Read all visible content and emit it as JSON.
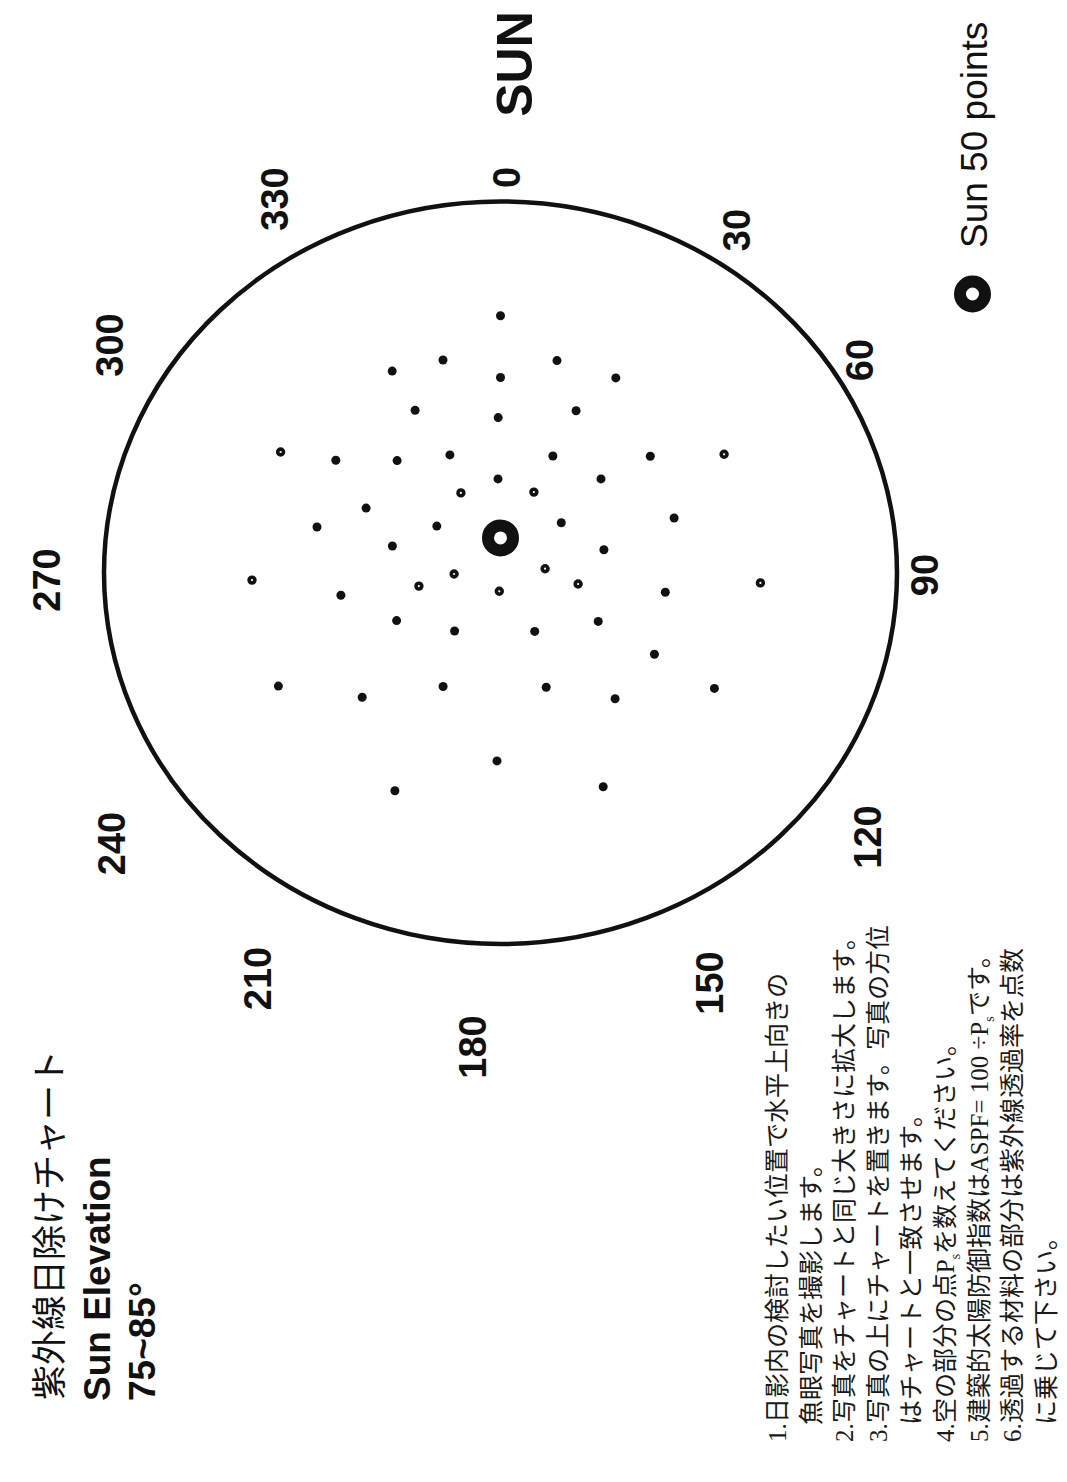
{
  "header": {
    "title_jp": "紫外線日除けチャート",
    "title_en": "Sun Elevation",
    "elevation_range": "75~85°"
  },
  "chart_data": {
    "type": "scatter",
    "projection": "polar sky chart",
    "title": "紫外線日除けチャート",
    "subtitle": "Sun Elevation 75~85°",
    "direction_label": "SUN",
    "angle_labels": [
      {
        "label": "0",
        "az": 0
      },
      {
        "label": "30",
        "az": 30
      },
      {
        "label": "60",
        "az": 60
      },
      {
        "label": "90",
        "az": 90
      },
      {
        "label": "120",
        "az": 120
      },
      {
        "label": "150",
        "az": 150
      },
      {
        "label": "180",
        "az": 180
      },
      {
        "label": "210",
        "az": 210
      },
      {
        "label": "240",
        "az": 240
      },
      {
        "label": "270",
        "az": 270
      },
      {
        "label": "300",
        "az": 300
      },
      {
        "label": "330",
        "az": 330
      }
    ],
    "r_range": [
      0,
      1
    ],
    "sun": {
      "az": 0,
      "r": 0.094,
      "marker": "ring"
    },
    "legend": [
      {
        "label": "Sun 50 points",
        "marker": "ring"
      }
    ],
    "point_count": 50,
    "points": [
      {
        "az": 0.0,
        "r": 0.692,
        "marker": "dot"
      },
      {
        "az": 345.8,
        "r": 0.591,
        "marker": "dot"
      },
      {
        "az": 14.0,
        "r": 0.589,
        "marker": "dot"
      },
      {
        "az": 333.3,
        "r": 0.608,
        "marker": "dot"
      },
      {
        "az": 0.0,
        "r": 0.526,
        "marker": "dot"
      },
      {
        "az": 29.0,
        "r": 0.6,
        "marker": "dot"
      },
      {
        "az": 333.8,
        "r": 0.488,
        "marker": "dot"
      },
      {
        "az": 23.6,
        "r": 0.476,
        "marker": "dot"
      },
      {
        "az": 359.2,
        "r": 0.418,
        "marker": "dot"
      },
      {
        "az": 300.4,
        "r": 0.643,
        "marker": "ring"
      },
      {
        "az": 306.1,
        "r": 0.514,
        "marker": "dot"
      },
      {
        "az": 319.2,
        "r": 0.399,
        "marker": "dot"
      },
      {
        "az": 338.1,
        "r": 0.342,
        "marker": "dot"
      },
      {
        "az": 22.8,
        "r": 0.341,
        "marker": "dot"
      },
      {
        "az": 50.3,
        "r": 0.491,
        "marker": "dot"
      },
      {
        "az": 60.5,
        "r": 0.648,
        "marker": "ring"
      },
      {
        "az": 358.6,
        "r": 0.253,
        "marker": "dot"
      },
      {
        "az": 45.1,
        "r": 0.358,
        "marker": "dot"
      },
      {
        "az": 335.1,
        "r": 0.237,
        "marker": "ring"
      },
      {
        "az": 21.2,
        "r": 0.233,
        "marker": "ring"
      },
      {
        "az": 297.2,
        "r": 0.381,
        "marker": "dot"
      },
      {
        "az": 71.4,
        "r": 0.462,
        "marker": "dot"
      },
      {
        "az": 284.9,
        "r": 0.479,
        "marker": "dot"
      },
      {
        "az": 308.0,
        "r": 0.204,
        "marker": "dot"
      },
      {
        "az": 48.7,
        "r": 0.204,
        "marker": "dot"
      },
      {
        "az": 284.8,
        "r": 0.282,
        "marker": "dot"
      },
      {
        "az": 76.6,
        "r": 0.268,
        "marker": "dot"
      },
      {
        "az": 268.2,
        "r": 0.627,
        "marker": "ring"
      },
      {
        "az": 268.4,
        "r": 0.117,
        "marker": "ring"
      },
      {
        "az": 84.4,
        "r": 0.113,
        "marker": "ring"
      },
      {
        "az": 92.4,
        "r": 0.656,
        "marker": "ring"
      },
      {
        "az": 260.1,
        "r": 0.209,
        "marker": "ring"
      },
      {
        "az": 98.8,
        "r": 0.198,
        "marker": "ring"
      },
      {
        "az": 261.4,
        "r": 0.407,
        "marker": "dot"
      },
      {
        "az": 183.4,
        "r": 0.05,
        "marker": "ring"
      },
      {
        "az": 97.2,
        "r": 0.419,
        "marker": "dot"
      },
      {
        "az": 243.8,
        "r": 0.292,
        "marker": "dot"
      },
      {
        "az": 118.0,
        "r": 0.279,
        "marker": "dot"
      },
      {
        "az": 216.4,
        "r": 0.195,
        "marker": "dot"
      },
      {
        "az": 151.4,
        "r": 0.18,
        "marker": "dot"
      },
      {
        "az": 119.5,
        "r": 0.446,
        "marker": "dot"
      },
      {
        "az": 241.4,
        "r": 0.638,
        "marker": "dot"
      },
      {
        "az": 205.3,
        "r": 0.339,
        "marker": "dot"
      },
      {
        "az": 159.5,
        "r": 0.329,
        "marker": "dot"
      },
      {
        "az": 120.0,
        "r": 0.623,
        "marker": "dot"
      },
      {
        "az": 226.1,
        "r": 0.484,
        "marker": "dot"
      },
      {
        "az": 139.6,
        "r": 0.446,
        "marker": "dot"
      },
      {
        "az": 181.0,
        "r": 0.507,
        "marker": "dot"
      },
      {
        "az": 204.4,
        "r": 0.645,
        "marker": "dot"
      },
      {
        "az": 155.8,
        "r": 0.632,
        "marker": "dot"
      }
    ]
  },
  "instructions": {
    "lines": [
      {
        "text": "1.日影内の検討したい位置で水平上向きの"
      },
      {
        "text": "魚眼写真を撮影します。",
        "indent": true
      },
      {
        "text": "2.写真をチャートと同じ大きさに拡大します。"
      },
      {
        "text": "3.写真の上にチャートを置きます。写真の方位"
      },
      {
        "text": "はチャートと一致させます。",
        "indent": true
      },
      {
        "pre": "4.空の部分の点P",
        "sub": "s",
        "post": "を数えてください。"
      },
      {
        "pre": "5.建築的太陽防御指数はASPF= 100 ÷P",
        "sub": "s",
        "post": "です。"
      },
      {
        "text": "6.透過する材料の部分は紫外線透過率を点数"
      },
      {
        "text": "に乗じて下さい。",
        "indent": true
      }
    ]
  }
}
